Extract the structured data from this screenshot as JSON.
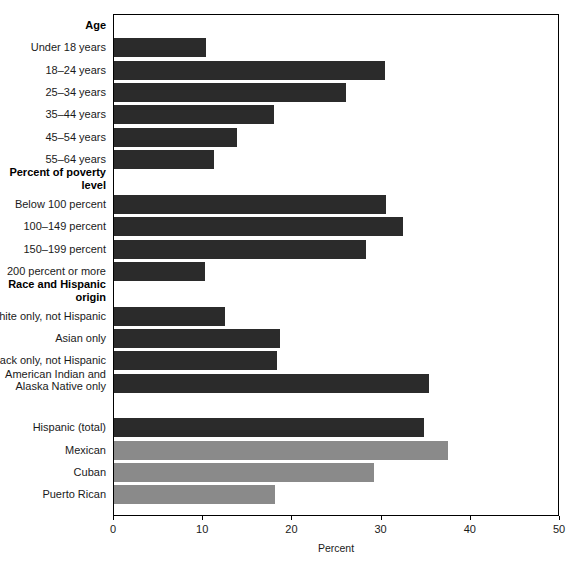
{
  "chart_data": {
    "type": "bar",
    "orientation": "horizontal",
    "title": "",
    "xlabel": "Percent",
    "ylabel": "",
    "xlim": [
      0,
      50
    ],
    "xticks": [
      0,
      10,
      20,
      30,
      40,
      50
    ],
    "xticklabels": [
      "0",
      "10",
      "20",
      "30",
      "40",
      "50"
    ],
    "grid": false,
    "legend": "none",
    "colors": {
      "dark_bar": "#2b2b2b",
      "light_bar": "#8a8a8a",
      "axis": "#000000",
      "text": "#1a1a1a"
    },
    "groups": [
      {
        "heading": "Age",
        "categories": [
          "Under 18 years",
          "18–24 years",
          "25–34 years",
          "35–44 years",
          "45–54 years",
          "55–64 years"
        ],
        "values": [
          10.3,
          30.4,
          26.0,
          17.9,
          13.8,
          11.2
        ],
        "shades": [
          "dark",
          "dark",
          "dark",
          "dark",
          "dark",
          "dark"
        ]
      },
      {
        "heading": "Percent of poverty\nlevel",
        "categories": [
          "Below 100 percent",
          "100–149 percent",
          "150–199 percent",
          "200 percent or more"
        ],
        "values": [
          30.5,
          32.4,
          28.2,
          10.2
        ],
        "shades": [
          "dark",
          "dark",
          "dark",
          "dark"
        ]
      },
      {
        "heading": "Race and Hispanic\norigin",
        "categories": [
          "White only, not Hispanic",
          "Asian only",
          "Black only, not Hispanic",
          "American Indian and\nAlaska Native only"
        ],
        "values": [
          12.4,
          18.6,
          18.3,
          35.3
        ],
        "shades": [
          "dark",
          "dark",
          "dark",
          "dark"
        ]
      },
      {
        "heading": "",
        "categories": [
          "Hispanic (total)",
          "Mexican",
          "Cuban",
          "Puerto Rican"
        ],
        "values": [
          34.7,
          37.4,
          29.1,
          18.1
        ],
        "shades": [
          "dark",
          "light",
          "light",
          "light"
        ]
      }
    ]
  },
  "axis": {
    "title": "Percent",
    "ticks": [
      "0",
      "10",
      "20",
      "30",
      "40",
      "50"
    ]
  },
  "rows": [
    {
      "label": "Age",
      "kind": "heading",
      "value": null,
      "shade": null
    },
    {
      "label": "Under 18 years",
      "kind": "bar",
      "value": 10.3,
      "shade": "dark"
    },
    {
      "label": "18–24 years",
      "kind": "bar",
      "value": 30.4,
      "shade": "dark"
    },
    {
      "label": "25–34 years",
      "kind": "bar",
      "value": 26.0,
      "shade": "dark"
    },
    {
      "label": "35–44 years",
      "kind": "bar",
      "value": 17.9,
      "shade": "dark"
    },
    {
      "label": "45–54 years",
      "kind": "bar",
      "value": 13.8,
      "shade": "dark"
    },
    {
      "label": "55–64 years",
      "kind": "bar",
      "value": 11.2,
      "shade": "dark"
    },
    {
      "label": "Percent of poverty\nlevel",
      "kind": "heading",
      "value": null,
      "shade": null
    },
    {
      "label": "Below 100 percent",
      "kind": "bar",
      "value": 30.5,
      "shade": "dark"
    },
    {
      "label": "100–149 percent",
      "kind": "bar",
      "value": 32.4,
      "shade": "dark"
    },
    {
      "label": "150–199 percent",
      "kind": "bar",
      "value": 28.2,
      "shade": "dark"
    },
    {
      "label": "200 percent or more",
      "kind": "bar",
      "value": 10.2,
      "shade": "dark"
    },
    {
      "label": "Race and Hispanic\norigin",
      "kind": "heading",
      "value": null,
      "shade": null
    },
    {
      "label": "White only, not Hispanic",
      "kind": "bar",
      "value": 12.4,
      "shade": "dark"
    },
    {
      "label": "Asian only",
      "kind": "bar",
      "value": 18.6,
      "shade": "dark"
    },
    {
      "label": "Black only, not Hispanic",
      "kind": "bar",
      "value": 18.3,
      "shade": "dark"
    },
    {
      "label": "American Indian and\nAlaska Native only",
      "kind": "bar",
      "value": 35.3,
      "shade": "dark"
    },
    {
      "label": "",
      "kind": "spacer",
      "value": null,
      "shade": null
    },
    {
      "label": "Hispanic (total)",
      "kind": "bar",
      "value": 34.7,
      "shade": "dark"
    },
    {
      "label": "Mexican",
      "kind": "bar",
      "value": 37.4,
      "shade": "light"
    },
    {
      "label": "Cuban",
      "kind": "bar",
      "value": 29.1,
      "shade": "light"
    },
    {
      "label": "Puerto Rican",
      "kind": "bar",
      "value": 18.1,
      "shade": "light"
    }
  ]
}
